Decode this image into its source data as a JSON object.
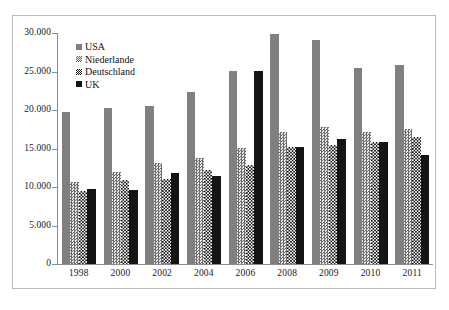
{
  "chart_data": {
    "type": "bar",
    "title": "",
    "xlabel": "",
    "ylabel": "",
    "ylim": [
      0,
      30000
    ],
    "grid": false,
    "legend_position": "top-left",
    "categories": [
      "1998",
      "2000",
      "2002",
      "2004",
      "2006",
      "2008",
      "2009",
      "2010",
      "2011"
    ],
    "ytick_labels": [
      "30.000",
      "25.000",
      "20.000",
      "15.000",
      "10.000",
      "5.000",
      "0"
    ],
    "ytick_values": [
      30000,
      25000,
      20000,
      15000,
      10000,
      5000,
      0
    ],
    "series": [
      {
        "name": "USA",
        "pattern": "solid-gray",
        "color": "#808080",
        "values": [
          19800,
          20300,
          20500,
          22400,
          25100,
          29900,
          29100,
          25500,
          25900
        ]
      },
      {
        "name": "Niederlande",
        "pattern": "fine-checker",
        "color": "#6d6d6d",
        "values": [
          10700,
          11900,
          13100,
          13800,
          15100,
          17200,
          17800,
          17100,
          17500
        ]
      },
      {
        "name": "Deutschland",
        "pattern": "bold-checker",
        "color": "#111111",
        "values": [
          9500,
          10900,
          11000,
          12200,
          12900,
          15200,
          15500,
          15900,
          16500
        ]
      },
      {
        "name": "UK",
        "pattern": "solid-black",
        "color": "#141414",
        "values": [
          9700,
          9600,
          11800,
          11400,
          25100,
          15200,
          16200,
          15800,
          14100
        ]
      }
    ]
  },
  "legend": {
    "items": [
      {
        "label": "USA",
        "key": "usa"
      },
      {
        "label": "Niederlande",
        "key": "nl"
      },
      {
        "label": "Deutschland",
        "key": "de"
      },
      {
        "label": "UK",
        "key": "uk"
      }
    ]
  },
  "top_strip": {
    "text": ""
  },
  "caption": {
    "text": ""
  }
}
